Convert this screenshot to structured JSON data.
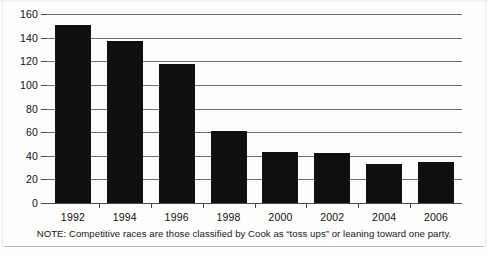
{
  "chart_data": {
    "type": "bar",
    "title": "",
    "subtitle": "",
    "xlabel": "",
    "ylabel": "",
    "categories": [
      "1992",
      "1994",
      "1996",
      "1998",
      "2000",
      "2002",
      "2004",
      "2006"
    ],
    "values": [
      151,
      137,
      118,
      61,
      43,
      42,
      33,
      35
    ],
    "series": [
      {
        "name": "Competitive races",
        "values": [
          151,
          137,
          118,
          61,
          43,
          42,
          33,
          35
        ]
      }
    ],
    "ylim": [
      0,
      160
    ],
    "yticks": [
      0,
      20,
      40,
      60,
      80,
      100,
      120,
      140,
      160
    ],
    "ytick_labels": [
      "0",
      "20",
      "40",
      "60",
      "80",
      "100",
      "120",
      "140",
      "160"
    ],
    "grid": true,
    "grid_axis": "y",
    "legend": false,
    "legend_position": "none",
    "bar_color": "#100f0e",
    "gridline_color": "#6f6f6d",
    "axis_color": "#4a4a48",
    "background_color": "#fdfdfc",
    "annotations": [
      "NOTE: Competitive races are those classified by Cook as “toss ups” or leaning toward one party."
    ]
  },
  "note": {
    "text": "NOTE: Competitive races are those classified by Cook as “toss ups” or leaning toward one party."
  }
}
